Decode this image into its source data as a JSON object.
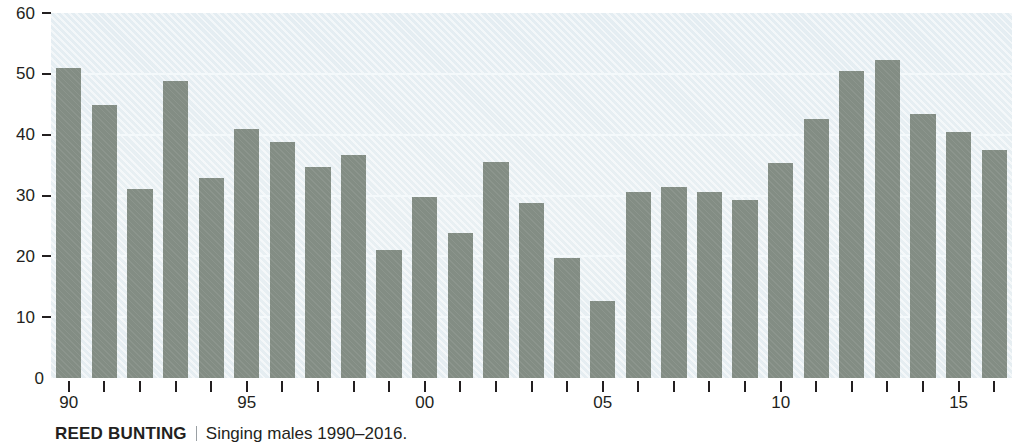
{
  "chart_data": {
    "type": "bar",
    "title": "REED BUNTING",
    "subtitle": "Singing males 1990–2016.",
    "xlabel": "",
    "ylabel": "",
    "ylim": [
      0,
      60
    ],
    "y_ticks": [
      0,
      10,
      20,
      30,
      40,
      50,
      60
    ],
    "y_tick_labels": [
      "0",
      "10",
      "20",
      "30",
      "40",
      "50",
      "60"
    ],
    "grid": true,
    "legend": "none",
    "categories": [
      "1990",
      "1991",
      "1992",
      "1993",
      "1994",
      "1995",
      "1996",
      "1997",
      "1998",
      "1999",
      "2000",
      "2001",
      "2002",
      "2003",
      "2004",
      "2005",
      "2006",
      "2007",
      "2008",
      "2009",
      "2010",
      "2011",
      "2012",
      "2013",
      "2014",
      "2015",
      "2016"
    ],
    "x_tick_labels": [
      "90",
      "95",
      "00",
      "05",
      "10",
      "15"
    ],
    "x_tick_indices": [
      0,
      5,
      10,
      15,
      20,
      25
    ],
    "values": [
      51.0,
      44.9,
      31.0,
      48.8,
      32.8,
      40.9,
      38.8,
      34.7,
      36.7,
      21.0,
      29.8,
      23.9,
      35.5,
      28.7,
      19.8,
      12.6,
      30.5,
      31.4,
      30.5,
      29.3,
      35.4,
      42.5,
      50.5,
      52.3,
      43.4,
      40.4,
      37.5
    ],
    "series_name": "Singing males",
    "colors": {
      "bar": "#838d84",
      "plot_background": "#e7eff3",
      "gridline": "#f4f9fb",
      "axis_text": "#231f20",
      "page_background": "#ffffff",
      "caption_divider": "#9aa0a4"
    }
  }
}
